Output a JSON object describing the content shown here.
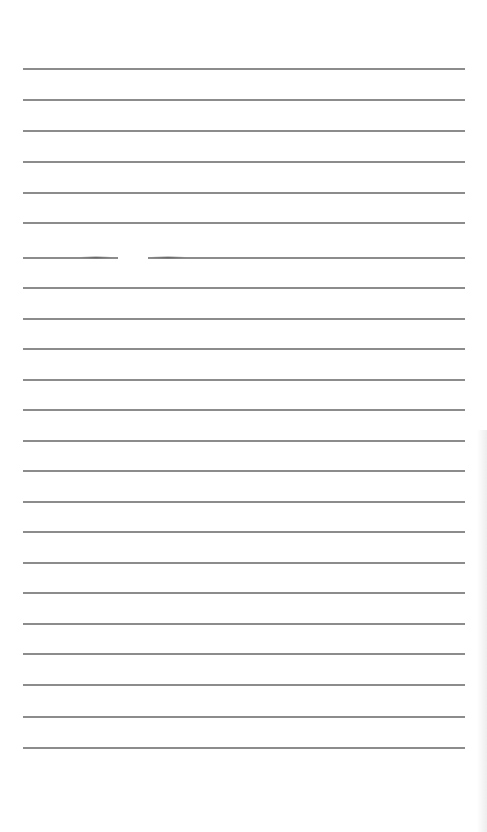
{
  "document": {
    "type": "lined-paper",
    "background_color": "#ffffff",
    "line_color": "#8c8c8c",
    "line_count": 23,
    "line_left_px": 23,
    "line_right_px": 465,
    "first_line_y_px": 68,
    "line_spacing_px": 30.86,
    "text_content": ""
  },
  "lines": [
    {
      "index": 0,
      "y": 68
    },
    {
      "index": 1,
      "y": 99
    },
    {
      "index": 2,
      "y": 130
    },
    {
      "index": 3,
      "y": 161
    },
    {
      "index": 4,
      "y": 192
    },
    {
      "index": 5,
      "y": 222
    },
    {
      "index": 6,
      "y": 257,
      "broken": true,
      "gap_start_x": 118,
      "gap_end_x": 148
    },
    {
      "index": 7,
      "y": 287
    },
    {
      "index": 8,
      "y": 318
    },
    {
      "index": 9,
      "y": 348
    },
    {
      "index": 10,
      "y": 379
    },
    {
      "index": 11,
      "y": 409
    },
    {
      "index": 12,
      "y": 440
    },
    {
      "index": 13,
      "y": 470
    },
    {
      "index": 14,
      "y": 501
    },
    {
      "index": 15,
      "y": 531
    },
    {
      "index": 16,
      "y": 562
    },
    {
      "index": 17,
      "y": 592
    },
    {
      "index": 18,
      "y": 623
    },
    {
      "index": 19,
      "y": 653
    },
    {
      "index": 20,
      "y": 684
    },
    {
      "index": 21,
      "y": 716
    },
    {
      "index": 22,
      "y": 747
    }
  ]
}
